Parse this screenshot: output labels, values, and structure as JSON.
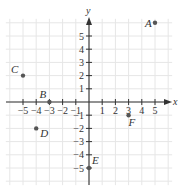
{
  "diagram": {
    "type": "coordinate-plane",
    "x_axis_label": "x",
    "y_axis_label": "y",
    "x_range": [
      -6,
      6
    ],
    "y_range": [
      -6,
      6
    ],
    "x_ticks": [
      -5,
      -4,
      -3,
      -2,
      -1,
      1,
      2,
      3,
      4,
      5
    ],
    "y_ticks": [
      5,
      4,
      3,
      2,
      1,
      -1,
      -2,
      -3,
      -4,
      -5
    ],
    "x_tick_labels": [
      "−5",
      "−4",
      "−3",
      "−2",
      "−1",
      "1",
      "2",
      "3",
      "4",
      "5"
    ],
    "y_tick_labels": [
      "5",
      "4",
      "3",
      "2",
      "1",
      "−1",
      "−2",
      "−3",
      "−4",
      "−5"
    ],
    "points": [
      {
        "label": "A",
        "x": 5,
        "y": 6
      },
      {
        "label": "B",
        "x": -3,
        "y": 0
      },
      {
        "label": "C",
        "x": -5,
        "y": 2
      },
      {
        "label": "D",
        "x": -4,
        "y": -2
      },
      {
        "label": "E",
        "x": 0,
        "y": -5
      },
      {
        "label": "F",
        "x": 3,
        "y": -1
      }
    ],
    "colors": {
      "grid": "#e6e6e6",
      "axis": "#333333",
      "point": "#555555"
    }
  }
}
